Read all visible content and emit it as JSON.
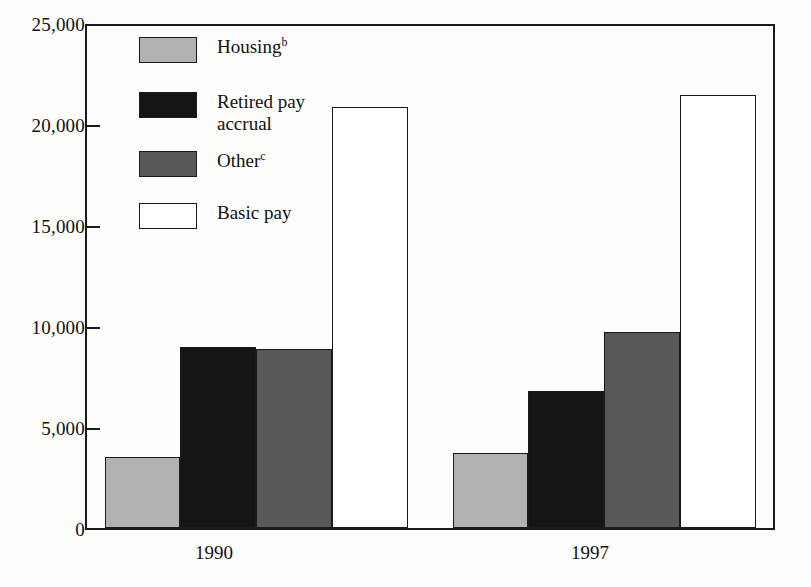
{
  "chart_data": {
    "type": "bar",
    "title": "",
    "subtitle": "",
    "xlabel": "",
    "ylabel": "",
    "categories": [
      "1990",
      "1997"
    ],
    "series": [
      {
        "name": "Housing",
        "name_superscript": "b",
        "color": "#b2b2b2",
        "values": [
          3500,
          3700
        ]
      },
      {
        "name": "Retired pay\naccrual",
        "name_superscript": "",
        "color": "#151515",
        "values": [
          9000,
          6800
        ]
      },
      {
        "name": "Other",
        "name_superscript": "c",
        "color": "#585858",
        "values": [
          8900,
          9700
        ]
      },
      {
        "name": "Basic pay",
        "name_superscript": "",
        "color": "#ffffff",
        "values": [
          20900,
          21500
        ]
      }
    ],
    "ylim": [
      0,
      25000
    ],
    "y_ticks": [
      0,
      5000,
      10000,
      15000,
      20000,
      25000
    ],
    "y_tick_labels": [
      "0",
      "5,000",
      "10,000",
      "15,000",
      "20,000",
      "25,000"
    ],
    "grid": false,
    "legend_position": "inside-top-left",
    "bar_style": "grouped-adjacent",
    "frame_color": "#1a1a1a"
  },
  "axis": {
    "y_labels": [
      "25,000",
      "20,000",
      "15,000",
      "10,000",
      "5,000",
      "0"
    ],
    "x_labels": [
      "1990",
      "1997"
    ]
  },
  "legend": {
    "items": [
      {
        "label": "Housing",
        "superscript": "b",
        "swatch": "swatch-housing"
      },
      {
        "label": "Retired pay\naccrual",
        "superscript": "",
        "swatch": "swatch-retired"
      },
      {
        "label": "Other",
        "superscript": "c",
        "swatch": "swatch-other"
      },
      {
        "label": "Basic pay",
        "superscript": "",
        "swatch": "swatch-basic"
      }
    ]
  }
}
